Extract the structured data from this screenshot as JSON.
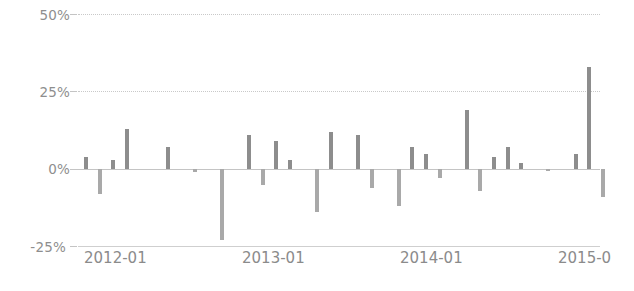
{
  "chart_data": {
    "type": "bar",
    "title": "",
    "subtitle": "",
    "xlabel": "",
    "ylabel": "",
    "ylim": [
      -25,
      50
    ],
    "grid": true,
    "legend_position": "none",
    "y_ticks": [
      "-25%",
      "0%",
      "25%",
      "50%"
    ],
    "y_tick_values": [
      -25,
      0,
      25,
      50
    ],
    "x_ticks": [
      "2012-01",
      "2013-01",
      "2014-01",
      "2015-0"
    ],
    "x_tick_values": [
      "2012-01",
      "2013-01",
      "2014-01",
      "2015-01"
    ],
    "bar_color": "#8d8d8d",
    "negative_bar_color": "#a9a9a9",
    "zero_line_color": "#c4c4c4",
    "gridline_color": "#c9c9c9",
    "axis_label_color": "#8b8b8b",
    "categories": [
      "2012-01",
      "2012-02",
      "2012-03",
      "2012-04",
      "2012-05",
      "2012-06",
      "2012-07",
      "2012-08",
      "2012-09",
      "2012-10",
      "2012-11",
      "2012-12",
      "2013-01",
      "2013-02",
      "2013-03",
      "2013-04",
      "2013-05",
      "2013-06",
      "2013-07",
      "2013-08",
      "2013-09",
      "2013-10",
      "2013-11",
      "2013-12",
      "2014-01",
      "2014-02",
      "2014-03",
      "2014-04",
      "2014-05",
      "2014-06",
      "2014-07",
      "2014-08",
      "2014-09",
      "2014-10",
      "2014-11",
      "2014-12",
      "2015-01",
      "2015-02",
      "2015-03"
    ],
    "values": [
      4,
      -8,
      3,
      13,
      0,
      0,
      7,
      0,
      -1,
      0,
      -23,
      0,
      11,
      -5,
      9,
      3,
      0,
      -14,
      12,
      0,
      11,
      -6,
      0,
      -12,
      7,
      5,
      -3,
      0,
      19,
      -7,
      4,
      7,
      2,
      0,
      -0.5,
      0,
      5,
      33,
      -9
    ],
    "values_unit": "percent",
    "point_count": 39
  }
}
